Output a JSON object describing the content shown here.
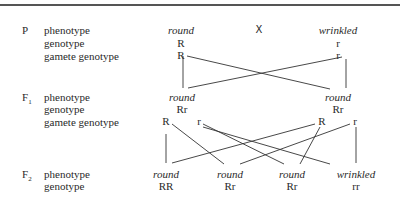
{
  "diagram": {
    "generations": {
      "P": {
        "label": "P",
        "row_labels": [
          "phenotype",
          "genotype",
          "gamete genotype"
        ],
        "cross_symbol": "X",
        "parent1": {
          "phenotype": "round",
          "genotype": "R",
          "gamete": "R"
        },
        "parent2": {
          "phenotype": "wrinkled",
          "genotype": "r",
          "gamete": "r"
        }
      },
      "F1": {
        "label": "F",
        "sub": "1",
        "row_labels": [
          "phenotype",
          "genotype",
          "gamete genotype"
        ],
        "individual1": {
          "phenotype": "round",
          "genotype": "Rr",
          "gametes": [
            "R",
            "r"
          ]
        },
        "individual2": {
          "phenotype": "round",
          "genotype": "Rr",
          "gametes": [
            "R",
            "r"
          ]
        }
      },
      "F2": {
        "label": "F",
        "sub": "2",
        "row_labels": [
          "phenotype",
          "genotype"
        ],
        "offspring": [
          {
            "phenotype": "round",
            "genotype": "RR"
          },
          {
            "phenotype": "round",
            "genotype": "Rr"
          },
          {
            "phenotype": "round",
            "genotype": "Rr"
          },
          {
            "phenotype": "wrinkled",
            "genotype": "rr"
          }
        ]
      }
    }
  }
}
